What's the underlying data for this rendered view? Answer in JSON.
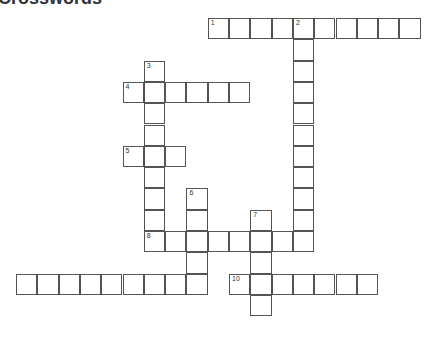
{
  "title": "Crosswords",
  "cell_size": 21.3,
  "cells": [
    {
      "r": 0,
      "c": 9,
      "n": "1"
    },
    {
      "r": 0,
      "c": 10
    },
    {
      "r": 0,
      "c": 11
    },
    {
      "r": 0,
      "c": 12
    },
    {
      "r": 0,
      "c": 13,
      "n": "2"
    },
    {
      "r": 0,
      "c": 14
    },
    {
      "r": 0,
      "c": 15
    },
    {
      "r": 0,
      "c": 16
    },
    {
      "r": 0,
      "c": 17
    },
    {
      "r": 0,
      "c": 18
    },
    {
      "r": 1,
      "c": 13
    },
    {
      "r": 2,
      "c": 13
    },
    {
      "r": 3,
      "c": 13
    },
    {
      "r": 4,
      "c": 13
    },
    {
      "r": 5,
      "c": 13
    },
    {
      "r": 6,
      "c": 13
    },
    {
      "r": 7,
      "c": 13
    },
    {
      "r": 8,
      "c": 13
    },
    {
      "r": 9,
      "c": 13
    },
    {
      "r": 2,
      "c": 6,
      "n": "3"
    },
    {
      "r": 3,
      "c": 5,
      "n": "4"
    },
    {
      "r": 3,
      "c": 6
    },
    {
      "r": 3,
      "c": 7
    },
    {
      "r": 3,
      "c": 8
    },
    {
      "r": 3,
      "c": 9
    },
    {
      "r": 3,
      "c": 10
    },
    {
      "r": 4,
      "c": 6
    },
    {
      "r": 5,
      "c": 6
    },
    {
      "r": 6,
      "c": 5,
      "n": "5"
    },
    {
      "r": 6,
      "c": 6
    },
    {
      "r": 6,
      "c": 7
    },
    {
      "r": 7,
      "c": 6
    },
    {
      "r": 8,
      "c": 6
    },
    {
      "r": 9,
      "c": 6
    },
    {
      "r": 8,
      "c": 8,
      "n": "6"
    },
    {
      "r": 9,
      "c": 8
    },
    {
      "r": 9,
      "c": 11,
      "n": "7"
    },
    {
      "r": 10,
      "c": 6,
      "n": "8"
    },
    {
      "r": 10,
      "c": 7
    },
    {
      "r": 10,
      "c": 8
    },
    {
      "r": 10,
      "c": 9
    },
    {
      "r": 10,
      "c": 10
    },
    {
      "r": 10,
      "c": 11
    },
    {
      "r": 10,
      "c": 12
    },
    {
      "r": 10,
      "c": 13
    },
    {
      "r": 11,
      "c": 8
    },
    {
      "r": 11,
      "c": 11
    },
    {
      "r": 12,
      "c": 0,
      "n": "9"
    },
    {
      "r": 12,
      "c": 1
    },
    {
      "r": 12,
      "c": 2
    },
    {
      "r": 12,
      "c": 3
    },
    {
      "r": 12,
      "c": 4
    },
    {
      "r": 12,
      "c": 5
    },
    {
      "r": 12,
      "c": 6
    },
    {
      "r": 12,
      "c": 7
    },
    {
      "r": 12,
      "c": 8
    },
    {
      "r": 12,
      "c": 10,
      "n": "10"
    },
    {
      "r": 12,
      "c": 11
    },
    {
      "r": 12,
      "c": 12
    },
    {
      "r": 12,
      "c": 13
    },
    {
      "r": 12,
      "c": 14
    },
    {
      "r": 12,
      "c": 15
    },
    {
      "r": 12,
      "c": 16
    },
    {
      "r": 13,
      "c": 11
    }
  ],
  "hidden_numbers": [
    "9"
  ]
}
